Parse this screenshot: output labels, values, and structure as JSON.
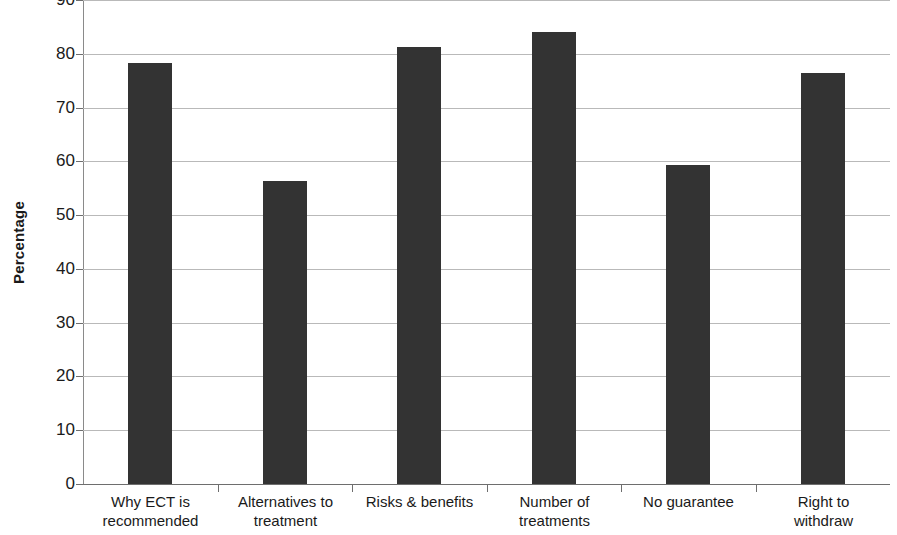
{
  "chart_data": {
    "type": "bar",
    "title": "",
    "xlabel": "",
    "ylabel": "Percentage",
    "ylim": [
      0,
      90
    ],
    "yticks": [
      0,
      10,
      20,
      30,
      40,
      50,
      60,
      70,
      80,
      90
    ],
    "ytick_labels": [
      "0",
      "10",
      "20",
      "30",
      "40",
      "50",
      "60",
      "70",
      "80",
      "90"
    ],
    "grid": true,
    "legend": "none",
    "categories": [
      "Why ECT is recommended",
      "Alternatives to treatment",
      "Risks & benefits",
      "Number of treatments",
      "No guarantee",
      "Right to withdraw"
    ],
    "category_lines": [
      [
        "Why ECT is",
        "recommended"
      ],
      [
        "Alternatives to",
        "treatment"
      ],
      [
        "Risks & benefits"
      ],
      [
        "Number of",
        "treatments"
      ],
      [
        "No guarantee"
      ],
      [
        "Right to",
        "withdraw"
      ]
    ],
    "values": [
      78.3,
      56.4,
      81.3,
      84.0,
      59.4,
      76.4
    ],
    "bar_color": "#333333",
    "gridline_color": "#b9b9b9",
    "axis_color": "#6e6e6e"
  }
}
